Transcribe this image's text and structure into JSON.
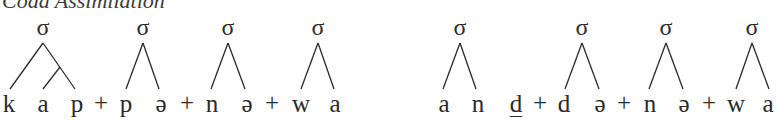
{
  "heading": "Coda Assimilation",
  "colors": {
    "ink": "#2a2a2a",
    "background": "#ffffff"
  },
  "left_form": {
    "label": "kap + pə + nə + wa",
    "syllables": [
      {
        "node": "σ",
        "segments": [
          "k",
          "a",
          "p"
        ],
        "note": "branching rhyme"
      },
      {
        "node": "σ",
        "segments": [
          "p",
          "ə"
        ]
      },
      {
        "node": "σ",
        "segments": [
          "n",
          "ə"
        ]
      },
      {
        "node": "σ",
        "segments": [
          "w",
          "a"
        ]
      }
    ],
    "plus_signs": [
      "+",
      "+",
      "+"
    ]
  },
  "right_form": {
    "label": "an d̲ + də + nə + wa",
    "syllables": [
      {
        "node": "σ",
        "segments": [
          "a",
          "n"
        ]
      },
      {
        "node": "σ",
        "segments": [
          "d",
          "ə"
        ]
      },
      {
        "node": "σ",
        "segments": [
          "n",
          "ə"
        ]
      },
      {
        "node": "σ",
        "segments": [
          "w",
          "a"
        ]
      }
    ],
    "extra_segment": {
      "text": "d",
      "underlined": true,
      "note": "unsyllabified"
    },
    "plus_signs": [
      "+",
      "+",
      "+"
    ]
  }
}
